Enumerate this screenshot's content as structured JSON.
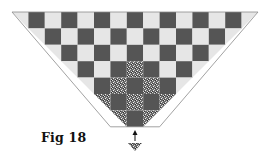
{
  "figure": {
    "label": "Fig 18"
  },
  "grid": {
    "origin_x": 12,
    "origin_y": 12,
    "cell": 16.4,
    "columns": 15,
    "rows": 7,
    "dark_when_parity": "odd",
    "speckled_cells": [
      {
        "row": 3,
        "col": 7
      },
      {
        "row": 4,
        "col": 6
      },
      {
        "row": 4,
        "col": 8
      },
      {
        "row": 5,
        "col": 5
      },
      {
        "row": 5,
        "col": 7
      },
      {
        "row": 5,
        "col": 9
      },
      {
        "row": 6,
        "col": 6
      },
      {
        "row": 6,
        "col": 8
      }
    ]
  },
  "colors": {
    "dark": "#555555",
    "light": "#e6e6e6",
    "speckle_base": "#6a6a6a",
    "edge": "#8a8a8a",
    "arrow": "#111111"
  },
  "arrow": {
    "direction": "up",
    "x": 135,
    "y_top": 130,
    "y_bottom": 141
  },
  "small_triangle": {
    "x_left": 128,
    "x_right": 142,
    "y_top": 143,
    "y_bottom": 151
  }
}
